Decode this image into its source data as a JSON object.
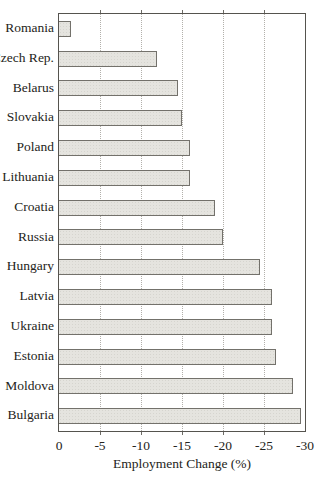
{
  "chart_data": {
    "type": "bar",
    "orientation": "horizontal",
    "title": "",
    "xlabel": "Employment Change (%)",
    "ylabel": "",
    "categories": [
      "Romania",
      "Czech Rep.",
      "Belarus",
      "Slovakia",
      "Poland",
      "Lithuania",
      "Croatia",
      "Russia",
      "Hungary",
      "Latvia",
      "Ukraine",
      "Estonia",
      "Moldova",
      "Bulgaria"
    ],
    "values": [
      -1.5,
      -12,
      -14.5,
      -15,
      -16,
      -16,
      -19,
      -20,
      -24.5,
      -26,
      -26,
      -26.5,
      -28.5,
      -29.5
    ],
    "xlim": [
      0,
      -30
    ],
    "xticks": [
      0,
      -5,
      -10,
      -15,
      -20,
      -25,
      -30
    ],
    "grid": "vertical-dotted-every-5",
    "legend": "none",
    "bar_fill": "#e5e4df",
    "bar_border": "#73716b",
    "frame_color": "#55534e",
    "text_color": "#242420",
    "background": "#ffffff"
  }
}
